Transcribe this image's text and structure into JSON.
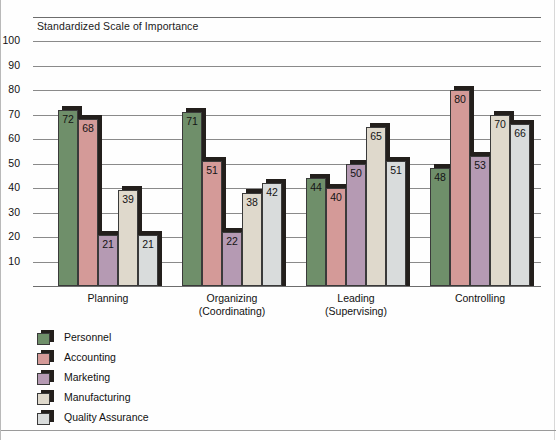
{
  "chart_data": {
    "type": "bar",
    "title": "Standardized Scale of Importance",
    "xlabel": "",
    "ylabel": "",
    "ylim": [
      0,
      100
    ],
    "yticks": [
      100,
      90,
      80,
      70,
      60,
      50,
      40,
      30,
      20,
      10
    ],
    "grid": true,
    "legend_position": "below-left",
    "categories": [
      "Planning",
      "Organizing\n(Coordinating)",
      "Leading\n(Supervising)",
      "Controlling"
    ],
    "category_lines": [
      [
        "Planning",
        ""
      ],
      [
        "Organizing",
        "(Coordinating)"
      ],
      [
        "Leading",
        "(Supervising)"
      ],
      [
        "Controlling",
        ""
      ]
    ],
    "series": [
      {
        "name": "Personnel",
        "color": "#6f8f6a",
        "values": [
          72,
          71,
          44,
          48
        ]
      },
      {
        "name": "Accounting",
        "color": "#d49a98",
        "values": [
          68,
          51,
          40,
          80
        ]
      },
      {
        "name": "Marketing",
        "color": "#b59ab3",
        "values": [
          21,
          22,
          50,
          53
        ]
      },
      {
        "name": "Manufacturing",
        "color": "#dfd9cc",
        "values": [
          39,
          38,
          65,
          70
        ]
      },
      {
        "name": "Quality Assurance",
        "color": "#d9dcdc",
        "values": [
          21,
          42,
          51,
          66
        ]
      }
    ]
  },
  "colors": {
    "shadow": "#231f1c",
    "gridline": "#8a8a8a",
    "axis": "#6d6d6d",
    "text": "#111111",
    "background": "#fefefe"
  }
}
